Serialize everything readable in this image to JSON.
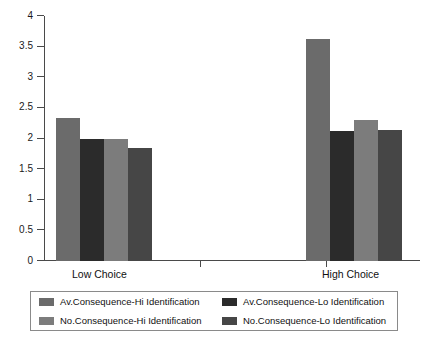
{
  "chart_data": {
    "type": "bar",
    "title": "",
    "xlabel": "",
    "ylabel": "",
    "categories": [
      "Low Choice",
      "High Choice"
    ],
    "ylim": [
      0,
      4
    ],
    "ytick_step": 0.5,
    "ytick_labels": [
      "0",
      "0.5",
      "1",
      "1.5",
      "2",
      "2.5",
      "3",
      "3.5",
      "4"
    ],
    "ytick_values": [
      0,
      0.5,
      1,
      1.5,
      2,
      2.5,
      3,
      3.5,
      4
    ],
    "grid": false,
    "legend_position": "bottom",
    "series": [
      {
        "name": "Av.Consequence-Hi Identification",
        "color": "#6b6b6b",
        "values": [
          2.33,
          3.62
        ]
      },
      {
        "name": "Av.Consequence-Lo Identification",
        "color": "#2b2b2b",
        "values": [
          2.0,
          2.12
        ]
      },
      {
        "name": "No.Consequence-Hi Identification",
        "color": "#7c7c7c",
        "values": [
          1.99,
          2.3
        ]
      },
      {
        "name": "No.Consequence-Lo Identification",
        "color": "#464646",
        "values": [
          1.85,
          2.14
        ]
      }
    ]
  },
  "axis": {
    "tick_color": "#4a4a4a"
  },
  "legend": {
    "border_color": "#8a8a8a",
    "entries": [
      {
        "label": "Av.Consequence-Hi Identification",
        "color": "#6b6b6b"
      },
      {
        "label": "Av.Consequence-Lo Identification",
        "color": "#2b2b2b"
      },
      {
        "label": "No.Consequence-Hi Identification",
        "color": "#7c7c7c"
      },
      {
        "label": "No.Consequence-Lo Identification",
        "color": "#464646"
      }
    ]
  }
}
